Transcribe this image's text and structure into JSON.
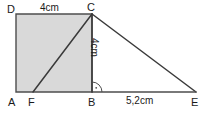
{
  "figure": {
    "type": "geometry-diagram",
    "colors": {
      "stroke": "#4d4d4d",
      "fill": "#d9d9d9",
      "text": "#1a1a1a",
      "background": "#ffffff"
    },
    "vertices": {
      "A": {
        "label": "A",
        "x": 16,
        "y": 92
      },
      "B": {
        "label": "B",
        "x": 92,
        "y": 92
      },
      "C": {
        "label": "C",
        "x": 92,
        "y": 14
      },
      "D": {
        "label": "D",
        "x": 16,
        "y": 14
      },
      "E": {
        "label": "E",
        "x": 196,
        "y": 92
      },
      "F": {
        "label": "F",
        "x": 33,
        "y": 92
      }
    },
    "dimensions": {
      "top_side": "4cm",
      "vertical_side": "4cm",
      "base_segment": "5,2cm"
    },
    "right_angle": {
      "at": "B",
      "marker": "right-angle-arc-with-dot"
    },
    "shaded_region": "square ABCD",
    "segments": [
      "D-C",
      "C-B",
      "B-A",
      "A-D",
      "F-C",
      "C-E",
      "B-E"
    ]
  }
}
